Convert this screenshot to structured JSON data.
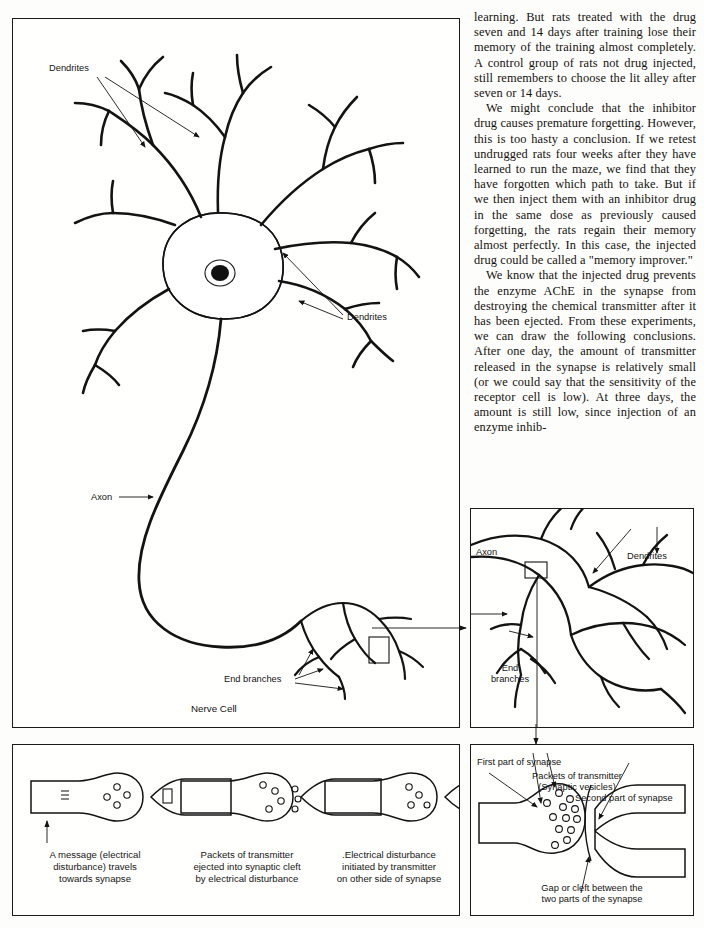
{
  "page": {
    "width": 704,
    "height": 928,
    "background": "#ffffff",
    "ink_color": "#131313"
  },
  "article": {
    "paragraphs": [
      "learning. But rats treated with the drug seven and 14 days after training lose their memory of the training almost completely. A control group of rats not drug injected, still remembers to choose the lit alley after seven or 14 days.",
      "We might conclude that the inhibitor drug causes premature forgetting. However, this is too hasty a conclusion. If we retest undrugged rats four weeks after they have learned to run the maze, we find that they have forgotten which path to take. But if we then inject them with an inhibitor drug in the same dose as previously caused forgetting, the rats regain their memory almost perfectly. In this case, the injected drug could be called a \"memory improver.\"",
      "We know that the injected drug prevents the enzyme AChE in the synapse from destroying the chemical transmitter after it has been ejected. From these experiments, we can draw the following conclusions. After one day, the amount of transmitter released in the synapse is relatively small (or we could say that the sensitivity of the receptor cell is low). At three days, the amount is still low, since injection of an enzyme inhib-"
    ]
  },
  "figures": {
    "nerve_cell": {
      "name": "Nerve Cell",
      "caption": "Nerve Cell",
      "labels": {
        "dendrites_top": "Dendrites",
        "dendrites_right": "Dendrites",
        "axon": "Axon",
        "end_branches": "End branches"
      }
    },
    "end_branch_detail": {
      "name": "End branch detail",
      "labels": {
        "axon": "Axon",
        "dendrites": "Dendrites",
        "end_branches": "End\nbranches"
      }
    },
    "synapse_stages": {
      "name": "Synapse transmission stages",
      "captions": [
        "A message (electrical\ndisturbance) travels\ntowards synapse",
        "Packets of transmitter\nejected into synaptic cleft\nby electrical disturbance",
        ".Electrical disturbance\ninitiated by transmitter\non other side of synapse"
      ]
    },
    "synapse_detail": {
      "name": "Synapse detail",
      "labels": {
        "first_part": "First part of synapse",
        "packets": "Packets of transmitter\n(Synaptic vesicles)",
        "second_part": "Second part of synapse",
        "gap": "Gap or cleft between the\ntwo parts of the synapse"
      }
    }
  }
}
